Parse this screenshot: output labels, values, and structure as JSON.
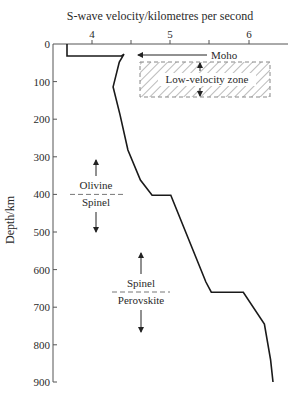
{
  "chart_data": {
    "type": "line",
    "title": "S-wave velocity/kilometres per second",
    "xlabel": "S-wave velocity/kilometres per second",
    "ylabel": "Depth/km",
    "x_axis_position": "top",
    "y_axis_inverted": true,
    "xlim": [
      3.5,
      6.5
    ],
    "ylim": [
      0,
      900
    ],
    "x_ticks": [
      4,
      4.5,
      5,
      5.5,
      6
    ],
    "x_tick_labels": [
      "4",
      "",
      "5",
      "",
      "6"
    ],
    "y_ticks": [
      0,
      100,
      200,
      300,
      400,
      500,
      600,
      700,
      800,
      900
    ],
    "y_tick_labels": [
      "0",
      "100",
      "200",
      "300",
      "400",
      "500",
      "600",
      "700",
      "800",
      "900"
    ],
    "grid": false,
    "series": [
      {
        "name": "S-wave velocity profile",
        "points": [
          {
            "velocity": 3.68,
            "depth": 0
          },
          {
            "velocity": 3.68,
            "depth": 32
          },
          {
            "velocity": 4.38,
            "depth": 32
          },
          {
            "velocity": 4.41,
            "depth": 27
          },
          {
            "velocity": 4.35,
            "depth": 48
          },
          {
            "velocity": 4.27,
            "depth": 114
          },
          {
            "velocity": 4.36,
            "depth": 189
          },
          {
            "velocity": 4.46,
            "depth": 282
          },
          {
            "velocity": 4.62,
            "depth": 362
          },
          {
            "velocity": 4.77,
            "depth": 402
          },
          {
            "velocity": 5.01,
            "depth": 402
          },
          {
            "velocity": 5.46,
            "depth": 633
          },
          {
            "velocity": 5.53,
            "depth": 660
          },
          {
            "velocity": 5.94,
            "depth": 660
          },
          {
            "velocity": 6.21,
            "depth": 745
          },
          {
            "velocity": 6.29,
            "depth": 840
          },
          {
            "velocity": 6.32,
            "depth": 899
          }
        ]
      }
    ],
    "annotations": [
      {
        "text": "Moho",
        "type": "arrow-label",
        "depth": 32
      },
      {
        "text": "Low-velocity zone",
        "type": "hatched-region",
        "depth_range": [
          50,
          140
        ],
        "velocity_range": [
          4.6,
          6.3
        ]
      },
      {
        "text": "Olivine",
        "type": "phase-boundary-upper",
        "depth": 400
      },
      {
        "text": "Spinel",
        "type": "phase-boundary-lower",
        "depth": 400
      },
      {
        "text": "Spinel",
        "type": "phase-boundary-upper",
        "depth": 660
      },
      {
        "text": "Perovskite",
        "type": "phase-boundary-lower",
        "depth": 660
      }
    ]
  },
  "labels": {
    "title": "S-wave velocity/kilometres per second",
    "ylabel": "Depth/km",
    "moho": "Moho",
    "lvz": "Low-velocity zone",
    "olivine": "Olivine",
    "spinel1": "Spinel",
    "spinel2": "Spinel",
    "perovskite": "Perovskite",
    "xt4": "4",
    "xt5": "5",
    "xt6": "6",
    "y0": "0",
    "y100": "100",
    "y200": "200",
    "y300": "300",
    "y400": "400",
    "y500": "500",
    "y600": "600",
    "y700": "700",
    "y800": "800",
    "y900": "900"
  },
  "colors": {
    "line": "#1a1a1a",
    "axis": "#555555",
    "text": "#2a2a2a"
  }
}
